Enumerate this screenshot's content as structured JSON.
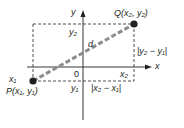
{
  "colors": {
    "ink": "#231f20",
    "segment": "#8c8c8c",
    "background": "#ffffff"
  },
  "axes": {
    "x_label": "x",
    "y_label": "y",
    "origin_label": "0"
  },
  "points": {
    "P": {
      "label": "P(x₁, y₁)"
    },
    "Q": {
      "label": "Q(x₂, y₂)"
    }
  },
  "labels": {
    "x1": "x₁",
    "x2": "x₂",
    "y1": "y₁",
    "y2": "y₂",
    "distance": "d",
    "dx": "|x₂ − x₁|",
    "dy": "|y₂ − y₁|"
  }
}
